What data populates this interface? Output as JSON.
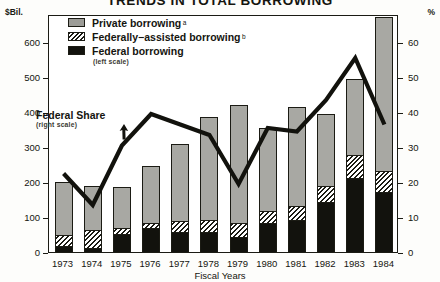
{
  "title": "TRENDS IN TOTAL BORROWING",
  "axes": {
    "left_unit": "$Bil.",
    "right_unit": "%",
    "xlabel": "Fiscal Years",
    "left_ticks": [
      0,
      100,
      200,
      300,
      400,
      500,
      600
    ],
    "right_ticks": [
      0,
      10,
      20,
      30,
      40,
      50,
      60
    ],
    "left_range": [
      0,
      680
    ],
    "right_range": [
      0,
      68
    ]
  },
  "legend": {
    "items": [
      {
        "label": "Private borrowing",
        "sup": "a",
        "swatch": "private-swatch"
      },
      {
        "label": "Federally−assisted borrowing",
        "sup": "b",
        "swatch": "assisted-swatch"
      },
      {
        "label": "Federal borrowing",
        "sup": "",
        "swatch": "federal-swatch"
      }
    ],
    "scale_note": "(left scale)"
  },
  "annotation": {
    "label": "Federal Share",
    "scale_note": "(right scale)",
    "icon": "arrow-up-icon"
  },
  "chart_data": {
    "type": "bar",
    "title": "TRENDS IN TOTAL BORROWING",
    "subtitle": "",
    "xlabel": "Fiscal Years",
    "ylabel": "$Bil.",
    "y2label": "%",
    "ylim": [
      0,
      680
    ],
    "y2lim": [
      0,
      68
    ],
    "grid": false,
    "legend_position": "top-center",
    "stacked": true,
    "categories": [
      "1973",
      "1974",
      "1975",
      "1976",
      "1977",
      "1978",
      "1979",
      "1980",
      "1981",
      "1982",
      "1983",
      "1984"
    ],
    "series": [
      {
        "name": "Federal borrowing",
        "axis": "left",
        "values": [
          13,
          10,
          50,
          65,
          55,
          55,
          40,
          80,
          90,
          140,
          210,
          170
        ]
      },
      {
        "name": "Federally−assisted borrowing",
        "axis": "left",
        "values": [
          32,
          50,
          15,
          15,
          30,
          35,
          40,
          35,
          40,
          45,
          65,
          60
        ]
      },
      {
        "name": "Private borrowing",
        "axis": "left",
        "values": [
          155,
          130,
          120,
          165,
          225,
          295,
          340,
          240,
          285,
          210,
          220,
          442
        ]
      }
    ],
    "cumulative_tops": {
      "federal": [
        13,
        10,
        50,
        65,
        55,
        55,
        40,
        80,
        90,
        140,
        210,
        170
      ],
      "assisted": [
        45,
        60,
        65,
        80,
        85,
        90,
        80,
        115,
        130,
        185,
        275,
        230
      ],
      "total": [
        200,
        190,
        185,
        245,
        310,
        385,
        420,
        355,
        415,
        395,
        495,
        672
      ]
    },
    "line_series": {
      "name": "Federal Share",
      "axis": "right",
      "values": [
        23,
        14,
        31,
        40,
        37,
        34,
        20,
        36,
        35,
        44,
        56,
        37
      ]
    }
  },
  "colors": {
    "private": "#a8a8a3",
    "federal": "#12120d",
    "line": "#12120d",
    "axis": "#1b1b14",
    "background": "#ffffff"
  }
}
